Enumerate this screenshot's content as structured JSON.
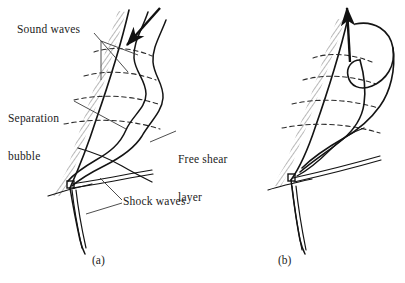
{
  "figure": {
    "kind": "technical-line-diagram",
    "background_color": "#ffffff",
    "ink_color": "#1a1a1a",
    "panels": [
      {
        "id": "a",
        "caption": "(a)",
        "arrow_direction": "down-left",
        "description": "incoming flow arrow, separation bubble, sound waves"
      },
      {
        "id": "b",
        "caption": "(b)",
        "arrow_direction": "up",
        "description": "upward arrow, rolled-up free shear layer"
      }
    ],
    "labels": [
      {
        "id": "sound-waves",
        "lines": [
          "Sound waves"
        ]
      },
      {
        "id": "separation-bubble",
        "lines": [
          "Separation",
          "bubble"
        ]
      },
      {
        "id": "free-shear-layer",
        "lines": [
          "Free shear",
          "layer"
        ]
      },
      {
        "id": "shock-waves",
        "lines": [
          "Shock waves"
        ]
      }
    ]
  },
  "labels": {
    "sound_waves": "Sound waves",
    "separation_line1": "Separation",
    "separation_line2": "bubble",
    "free_shear_line1": "Free shear",
    "free_shear_line2": "layer",
    "shock_waves": "Shock waves"
  },
  "captions": {
    "panel_a": "(a)",
    "panel_b": "(b)"
  },
  "elements": {
    "wall_hatching": "hatched-wall",
    "sound_wave_arcs": "dashed-arcs",
    "shear_layer": "wavy-solid-lines",
    "shock_waves": "double-solid-lines",
    "corner_marker": "small-square",
    "flow_arrow_a": "arrow-down-left",
    "flow_arrow_b": "arrow-up"
  }
}
